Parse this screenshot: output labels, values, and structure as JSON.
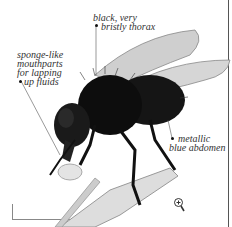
{
  "diagram": {
    "labels": {
      "thorax": [
        "black, very",
        "bristly thorax"
      ],
      "mouthparts": [
        "sponge-like",
        "mouthparts",
        "for lapping",
        "up fluids"
      ],
      "abdomen": [
        "metallic",
        "blue abdomen"
      ]
    },
    "controls": {
      "zoom_icon": "zoom-in-icon"
    },
    "colors": {
      "label_text": "#333333",
      "fly_body": "#111111",
      "wing": "#c8c8c8",
      "border": "#555555"
    }
  }
}
